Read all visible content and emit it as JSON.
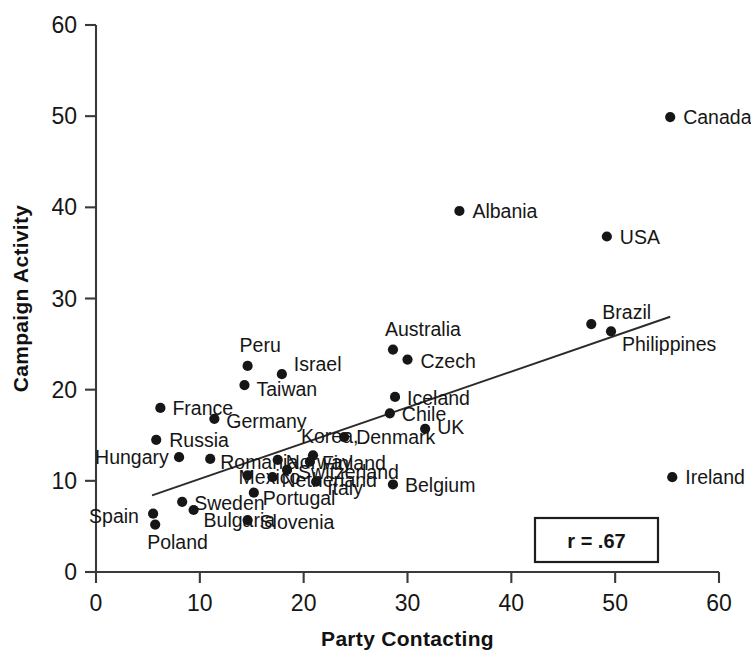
{
  "chart_data": {
    "type": "scatter",
    "title": "",
    "xlabel": "Party Contacting",
    "ylabel": "Campaign Activity",
    "xlim": [
      0,
      60
    ],
    "ylim": [
      0,
      60
    ],
    "xticks": [
      0,
      10,
      20,
      30,
      40,
      50,
      60
    ],
    "yticks": [
      0,
      10,
      20,
      30,
      40,
      50,
      60
    ],
    "xtick_labels": [
      "0",
      "10",
      "20",
      "30",
      "40",
      "50",
      "60"
    ],
    "ytick_labels": [
      "0",
      "10",
      "20",
      "30",
      "40",
      "50",
      "60"
    ],
    "grid": false,
    "legend": "none",
    "annotation": "r = .67",
    "correlation": 0.67,
    "trendline": {
      "type": "linear",
      "x_start": 5.4,
      "y_start": 8.4,
      "x_end": 55.3,
      "y_end": 28.0
    },
    "points": [
      {
        "label": "Canada",
        "x": 55.3,
        "y": 49.9,
        "label_dx": 13,
        "label_dy": 7
      },
      {
        "label": "Albania",
        "x": 35.0,
        "y": 39.6,
        "label_dx": 13,
        "label_dy": 7
      },
      {
        "label": "USA",
        "x": 49.2,
        "y": 36.8,
        "label_dx": 13,
        "label_dy": 7
      },
      {
        "label": "Brazil",
        "x": 47.7,
        "y": 27.2,
        "label_dx": 11,
        "label_dy": -5
      },
      {
        "label": "Philippines",
        "x": 49.6,
        "y": 26.4,
        "label_dx": 11,
        "label_dy": 20
      },
      {
        "label": "Australia",
        "x": 28.6,
        "y": 24.4,
        "label_dx": -8,
        "label_dy": -14
      },
      {
        "label": "Czech",
        "x": 30.0,
        "y": 23.3,
        "label_dx": 13,
        "label_dy": 8
      },
      {
        "label": "Peru",
        "x": 14.6,
        "y": 22.6,
        "label_dx": -8,
        "label_dy": -14
      },
      {
        "label": "Israel",
        "x": 17.9,
        "y": 21.7,
        "label_dx": 12,
        "label_dy": -3
      },
      {
        "label": "Taiwan",
        "x": 14.3,
        "y": 20.5,
        "label_dx": 12,
        "label_dy": 11
      },
      {
        "label": "Iceland",
        "x": 28.8,
        "y": 19.2,
        "label_dx": 12,
        "label_dy": 8
      },
      {
        "label": "France",
        "x": 6.2,
        "y": 18.0,
        "label_dx": 12,
        "label_dy": 7
      },
      {
        "label": "Chile",
        "x": 28.3,
        "y": 17.4,
        "label_dx": 12,
        "label_dy": 8
      },
      {
        "label": "Germany",
        "x": 11.4,
        "y": 16.8,
        "label_dx": 12,
        "label_dy": 9
      },
      {
        "label": "UK",
        "x": 31.7,
        "y": 15.7,
        "label_dx": 12,
        "label_dy": 5
      },
      {
        "label": "Denmark",
        "x": 23.9,
        "y": 14.8,
        "label_dx": 12,
        "label_dy": 7
      },
      {
        "label": "Russia",
        "x": 5.8,
        "y": 14.5,
        "label_dx": 13,
        "label_dy": 7
      },
      {
        "label": "Korea,",
        "x": 20.9,
        "y": 12.8,
        "label_dx": -12,
        "label_dy": -12
      },
      {
        "label": "Hungary",
        "x": 8.0,
        "y": 12.6,
        "label_dx": -84,
        "label_dy": 7
      },
      {
        "label": "Romania",
        "x": 11.0,
        "y": 12.4,
        "label_dx": 10,
        "label_dy": 10
      },
      {
        "label": "Norway",
        "x": 17.5,
        "y": 12.3,
        "label_dx": 8,
        "label_dy": 9
      },
      {
        "label": "Finland",
        "x": 20.6,
        "y": 12.1,
        "label_dx": 12,
        "label_dy": 8
      },
      {
        "label": "Switzerland",
        "x": 18.4,
        "y": 11.2,
        "label_dx": 11,
        "label_dy": 9
      },
      {
        "label": "Mexico",
        "x": 14.6,
        "y": 10.6,
        "label_dx": -9,
        "label_dy": 9
      },
      {
        "label": "Netherland",
        "x": 17.0,
        "y": 10.4,
        "label_dx": 9,
        "label_dy": 10
      },
      {
        "label": "Italy",
        "x": 21.2,
        "y": 9.9,
        "label_dx": 11,
        "label_dy": 13
      },
      {
        "label": "Ireland",
        "x": 55.5,
        "y": 10.4,
        "label_dx": 13,
        "label_dy": 7
      },
      {
        "label": "Belgium",
        "x": 28.6,
        "y": 9.6,
        "label_dx": 12,
        "label_dy": 8
      },
      {
        "label": "Portugal",
        "x": 15.2,
        "y": 8.7,
        "label_dx": 9,
        "label_dy": 12
      },
      {
        "label": "Sweden",
        "x": 8.3,
        "y": 7.7,
        "label_dx": 12,
        "label_dy": 8
      },
      {
        "label": "Bulgaria",
        "x": 9.4,
        "y": 6.8,
        "label_dx": 10,
        "label_dy": 17
      },
      {
        "label": "Spain",
        "x": 5.5,
        "y": 6.4,
        "label_dx": -64,
        "label_dy": 9
      },
      {
        "label": "Slovenia",
        "x": 14.6,
        "y": 5.7,
        "label_dx": 12,
        "label_dy": 9
      },
      {
        "label": "Poland",
        "x": 5.7,
        "y": 5.2,
        "label_dx": -8,
        "label_dy": 24
      }
    ]
  },
  "axes": {
    "x_title": "Party Contacting",
    "y_title": "Campaign Activity"
  },
  "annotation": {
    "text": "r = .67"
  },
  "colors": {
    "marker": "#161616",
    "axis": "#3a3a3a",
    "trendline": "#2b2b2b",
    "background": "#ffffff"
  }
}
